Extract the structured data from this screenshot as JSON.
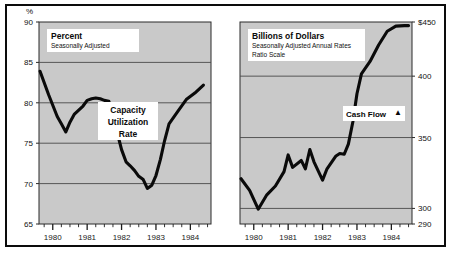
{
  "figure": {
    "background": "#ffffff",
    "frame_color": "#0c0c0c",
    "plot_fill": "#c9c9c9",
    "line_color": "#0a0a0a",
    "grid_color": "#4a4a4a",
    "footnote": ""
  },
  "chart_data": [
    {
      "type": "line",
      "id": "capacity-utilization",
      "title": "Percent",
      "subtitle": "Seasonally Adjusted",
      "series_label": "Capacity Utilization Rate",
      "series_label_lines": [
        "Capacity",
        "Utilization",
        "Rate"
      ],
      "axis_corner_label": "%",
      "ylabel": "Percent",
      "xlabel": "",
      "ylim": [
        65,
        90
      ],
      "yticks": [
        65,
        70,
        75,
        80,
        85,
        90
      ],
      "ytick_labels": [
        "65",
        "70",
        "75",
        "80",
        "85",
        "90"
      ],
      "gridlines": [
        70,
        75,
        80,
        85
      ],
      "grid": true,
      "xlim": [
        1979.6,
        1984.6
      ],
      "xticks": [
        1980,
        1981,
        1982,
        1983,
        1984
      ],
      "xtick_labels": [
        "1980",
        "1981",
        "1982",
        "1983",
        "1984"
      ],
      "minor_xticks_per_year": 4,
      "legend_position": "inside-center",
      "x": [
        1979.63,
        1979.88,
        1980.13,
        1980.25,
        1980.38,
        1980.5,
        1980.63,
        1980.88,
        1981.0,
        1981.13,
        1981.25,
        1981.38,
        1981.5,
        1981.63,
        1981.75,
        1981.88,
        1982.0,
        1982.13,
        1982.25,
        1982.38,
        1982.5,
        1982.63,
        1982.75,
        1982.88,
        1983.0,
        1983.13,
        1983.25,
        1983.38,
        1983.63,
        1983.88,
        1984.13,
        1984.38
      ],
      "values": [
        83.9,
        81.0,
        78.3,
        77.4,
        76.4,
        77.6,
        78.6,
        79.6,
        80.3,
        80.5,
        80.6,
        80.5,
        80.3,
        80.2,
        78.6,
        76.2,
        74.2,
        72.7,
        72.2,
        71.6,
        70.9,
        70.5,
        69.4,
        69.8,
        71.0,
        73.0,
        75.3,
        77.4,
        78.9,
        80.4,
        81.2,
        82.2
      ]
    },
    {
      "type": "line",
      "id": "cash-flow",
      "title": "Billions of Dollars",
      "subtitle": "Seasonally Adjusted Annual Rates",
      "subtitle2": "Ratio Scale",
      "series_label": "Cash Flow",
      "series_marker": "▲",
      "ylabel": "Billions of Dollars",
      "xlabel": "",
      "scale": "ratio",
      "ylim": [
        290,
        450
      ],
      "yticks": [
        290,
        300,
        350,
        400,
        450
      ],
      "ytick_labels": [
        "290",
        "300",
        "350",
        "400",
        "$450"
      ],
      "gridlines": [
        300,
        350,
        400
      ],
      "grid": true,
      "xlim": [
        1979.6,
        1984.6
      ],
      "xticks": [
        1980,
        1981,
        1982,
        1983,
        1984
      ],
      "xtick_labels": [
        "1980",
        "1981",
        "1982",
        "1983",
        "1984"
      ],
      "minor_xticks_per_year": 4,
      "legend_position": "inside-right",
      "x": [
        1979.63,
        1979.88,
        1980.13,
        1980.38,
        1980.63,
        1980.88,
        1981.0,
        1981.13,
        1981.38,
        1981.5,
        1981.63,
        1981.75,
        1982.0,
        1982.13,
        1982.38,
        1982.5,
        1982.63,
        1982.75,
        1982.88,
        1983.0,
        1983.13,
        1983.38,
        1983.63,
        1983.88,
        1984.13,
        1984.38,
        1984.5
      ],
      "values": [
        320.0,
        312.0,
        299.5,
        309.0,
        315.0,
        325.0,
        337.0,
        328.0,
        333.0,
        327.0,
        341.0,
        332.0,
        319.0,
        327.0,
        336.0,
        338.0,
        337.5,
        345.0,
        362.0,
        385.0,
        402.0,
        413.0,
        428.0,
        441.0,
        446.0,
        446.5,
        446.5
      ]
    }
  ]
}
